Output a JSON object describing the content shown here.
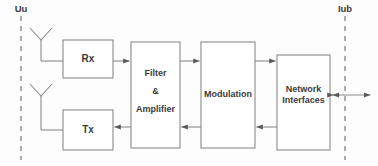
{
  "diagram": {
    "style": {
      "stroke": "#808080",
      "text_color": "#3a3a3a",
      "background": "#fdfdfd",
      "line_width": 1
    },
    "interfaces": [
      {
        "id": "uu",
        "label": "Uu",
        "kind": "dashed-boundary",
        "x": 21,
        "label_x": 21,
        "label_y": 4,
        "line_top": 16,
        "line_bottom": 160
      },
      {
        "id": "iub",
        "label": "Iub",
        "kind": "dashed-boundary",
        "x": 345,
        "label_x": 345,
        "label_y": 4,
        "line_top": 16,
        "line_bottom": 160
      }
    ],
    "antennas": [
      {
        "id": "rx-antenna",
        "name": "receive-antenna",
        "apex_x": 41,
        "apex_y": 40,
        "spread": 11,
        "arm_top": 28,
        "stem_bottom": 61
      },
      {
        "id": "tx-antenna",
        "name": "transmit-antenna",
        "apex_x": 41,
        "apex_y": 96,
        "spread": 11,
        "arm_top": 84,
        "stem_bottom": 130
      }
    ],
    "boxes": [
      {
        "id": "rx",
        "label": "Rx",
        "x": 63,
        "y": 40,
        "w": 50,
        "h": 38,
        "font": "rxtx-lbl"
      },
      {
        "id": "tx",
        "label": "Tx",
        "x": 63,
        "y": 110,
        "w": 50,
        "h": 40,
        "font": "rxtx-lbl"
      },
      {
        "id": "filter",
        "label": "Filter\n&\nAmplifier",
        "x": 131,
        "y": 42,
        "w": 49,
        "h": 106,
        "font": "box-lbl"
      },
      {
        "id": "modulation",
        "label": "Modulation",
        "x": 201,
        "y": 42,
        "w": 54,
        "h": 106,
        "font": "box-lbl"
      },
      {
        "id": "network",
        "label": "Network\nInterfaces",
        "x": 277,
        "y": 55,
        "w": 53,
        "h": 95,
        "font": "box-lbl"
      }
    ],
    "connections": [
      {
        "id": "antenna-to-rx",
        "from": "rx-antenna",
        "to": "rx",
        "direction": "right",
        "y": 61
      },
      {
        "id": "rx-to-filter",
        "from": "rx",
        "to": "filter",
        "direction": "right",
        "y": 61
      },
      {
        "id": "filter-to-modulation",
        "from": "filter",
        "to": "modulation",
        "direction": "right",
        "y": 61
      },
      {
        "id": "modulation-to-network",
        "from": "modulation",
        "to": "network",
        "direction": "right",
        "y": 61
      },
      {
        "id": "network-to-modulation",
        "from": "network",
        "to": "modulation",
        "direction": "left",
        "y": 127
      },
      {
        "id": "modulation-to-filter",
        "from": "modulation",
        "to": "filter",
        "direction": "left",
        "y": 127
      },
      {
        "id": "filter-to-tx",
        "from": "filter",
        "to": "tx",
        "direction": "left",
        "y": 127
      },
      {
        "id": "tx-to-antenna",
        "from": "tx",
        "to": "tx-antenna",
        "direction": "left",
        "y": 130
      },
      {
        "id": "network-to-iub",
        "from": "network",
        "to": "iub",
        "direction": "both",
        "y": 95
      }
    ]
  }
}
